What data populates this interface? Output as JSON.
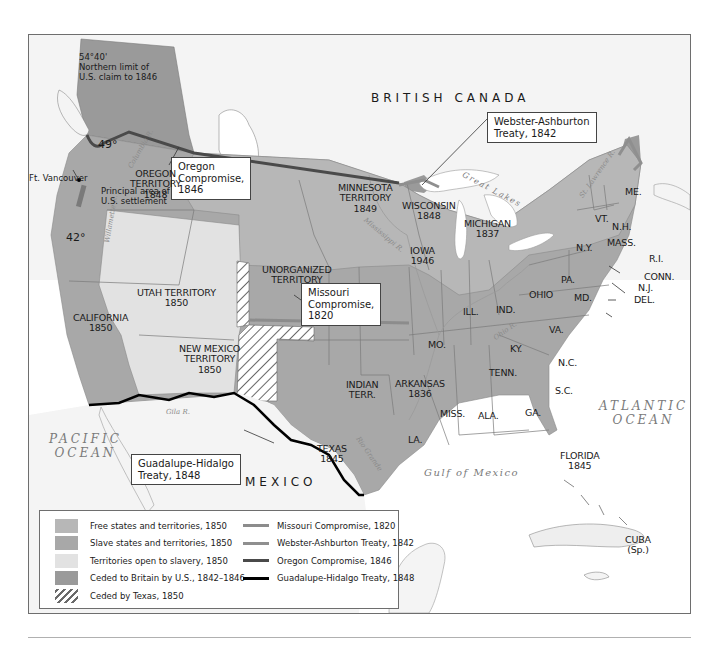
{
  "map": {
    "colors": {
      "free": "#b7b7b7",
      "slave": "#a8a8a8",
      "open_to_slavery": "#e2e2e2",
      "ceded_britain": "#9a9a9a",
      "foreign_land": "#f3f3f3",
      "water": "#ffffff",
      "missouri_line": "#8c8c8c",
      "webster_line": "#8f8f8f",
      "oregon_line": "#4a4a4a",
      "guadalupe_line": "#000000"
    },
    "countries": {
      "british_canada": "BRITISH CANADA",
      "mexico": "MEXICO"
    },
    "oceans": {
      "pacific": [
        "PACIFIC",
        "OCEAN"
      ],
      "atlantic": [
        "ATLANTIC",
        "OCEAN"
      ],
      "gulf": "Gulf of Mexico",
      "great_lakes": "Great Lakes"
    },
    "rivers": {
      "columbia": "Columbia R.",
      "willamette": "Willamette R.",
      "mississippi": "Mississippi R.",
      "ohio": "Ohio R.",
      "gila": "Gila R.",
      "rio_grande": "Rio Grande",
      "st_lawrence": "St. Lawrence R."
    },
    "notes": {
      "northern_limit": [
        "54°40'",
        "Northern limit of",
        "U.S. claim to 1846"
      ],
      "deg49": "49°",
      "deg42": "42°",
      "parallel_3630": "36°30'",
      "ft_vancouver": "Ft. Vancouver",
      "settlement": [
        "Principal area of",
        "U.S. settlement"
      ]
    },
    "callouts": {
      "oregon": [
        "Oregon",
        "Compromise,",
        "1846"
      ],
      "webster": [
        "Webster-Ashburton",
        "Treaty, 1842"
      ],
      "missouri": [
        "Missouri",
        "Compromise,",
        "1820"
      ],
      "guadalupe": [
        "Guadalupe-Hidalgo",
        "Treaty, 1848"
      ]
    },
    "regions": [
      {
        "id": "oregon-territory",
        "lines": [
          "OREGON",
          "TERRITORY",
          "1848"
        ]
      },
      {
        "id": "minnesota-territory",
        "lines": [
          "MINNESOTA",
          "TERRITORY",
          "1849"
        ]
      },
      {
        "id": "wisconsin",
        "lines": [
          "WISCONSIN",
          "1848"
        ]
      },
      {
        "id": "michigan",
        "lines": [
          "MICHIGAN",
          "1837"
        ]
      },
      {
        "id": "iowa",
        "lines": [
          "IOWA",
          "1946"
        ]
      },
      {
        "id": "unorganized-territory",
        "lines": [
          "UNORGANIZED",
          "TERRITORY"
        ]
      },
      {
        "id": "utah-territory",
        "lines": [
          "UTAH TERRITORY",
          "1850"
        ]
      },
      {
        "id": "california",
        "lines": [
          "CALIFORNIA",
          "1850"
        ]
      },
      {
        "id": "new-mexico-territory",
        "lines": [
          "NEW MEXICO",
          "TERRITORY",
          "1850"
        ]
      },
      {
        "id": "texas",
        "lines": [
          "TEXAS",
          "1845"
        ]
      },
      {
        "id": "indian-territory",
        "lines": [
          "INDIAN",
          "TERR."
        ]
      },
      {
        "id": "arkansas",
        "lines": [
          "ARKANSAS",
          "1836"
        ]
      },
      {
        "id": "missouri",
        "lines": [
          "MO."
        ]
      },
      {
        "id": "illinois",
        "lines": [
          "ILL."
        ]
      },
      {
        "id": "indiana",
        "lines": [
          "IND."
        ]
      },
      {
        "id": "ohio",
        "lines": [
          "OHIO"
        ]
      },
      {
        "id": "kentucky",
        "lines": [
          "KY."
        ]
      },
      {
        "id": "tennessee",
        "lines": [
          "TENN."
        ]
      },
      {
        "id": "mississippi",
        "lines": [
          "MISS."
        ]
      },
      {
        "id": "alabama",
        "lines": [
          "ALA."
        ]
      },
      {
        "id": "georgia",
        "lines": [
          "GA."
        ]
      },
      {
        "id": "louisiana",
        "lines": [
          "LA."
        ]
      },
      {
        "id": "florida",
        "lines": [
          "FLORIDA",
          "1845"
        ]
      },
      {
        "id": "south-carolina",
        "lines": [
          "S.C."
        ]
      },
      {
        "id": "north-carolina",
        "lines": [
          "N.C."
        ]
      },
      {
        "id": "virginia",
        "lines": [
          "VA."
        ]
      },
      {
        "id": "maryland",
        "lines": [
          "MD."
        ]
      },
      {
        "id": "pennsylvania",
        "lines": [
          "PA."
        ]
      },
      {
        "id": "new-york",
        "lines": [
          "N.Y."
        ]
      },
      {
        "id": "vermont",
        "lines": [
          "VT."
        ]
      },
      {
        "id": "new-hampshire",
        "lines": [
          "N.H."
        ]
      },
      {
        "id": "massachusetts",
        "lines": [
          "MASS."
        ]
      },
      {
        "id": "maine",
        "lines": [
          "ME."
        ]
      },
      {
        "id": "rhode-island",
        "lines": [
          "R.I."
        ]
      },
      {
        "id": "connecticut",
        "lines": [
          "CONN."
        ]
      },
      {
        "id": "new-jersey",
        "lines": [
          "N.J."
        ]
      },
      {
        "id": "delaware",
        "lines": [
          "DEL."
        ]
      },
      {
        "id": "cuba",
        "lines": [
          "CUBA",
          "(Sp.)"
        ]
      }
    ]
  },
  "legend": {
    "areas": [
      {
        "label": "Free states and territories, 1850",
        "color": "#b7b7b7",
        "hatch": false
      },
      {
        "label": "Slave states and territories, 1850",
        "color": "#a8a8a8",
        "hatch": false
      },
      {
        "label": "Territories open to slavery, 1850",
        "color": "#e2e2e2",
        "hatch": false
      },
      {
        "label": "Ceded to Britain by U.S., 1842–1846",
        "color": "#9a9a9a",
        "hatch": false
      },
      {
        "label": "Ceded by Texas, 1850",
        "color": "#ffffff",
        "hatch": true
      }
    ],
    "lines": [
      {
        "label": "Missouri Compromise, 1820",
        "color": "#8c8c8c"
      },
      {
        "label": "Webster-Ashburton Treaty, 1842",
        "color": "#8f8f8f"
      },
      {
        "label": "Oregon Compromise, 1846",
        "color": "#4a4a4a"
      },
      {
        "label": "Guadalupe-Hidalgo Treaty, 1848",
        "color": "#000000"
      }
    ]
  }
}
